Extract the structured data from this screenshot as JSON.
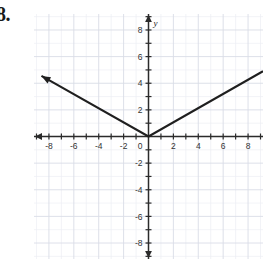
{
  "problem": {
    "number": "8."
  },
  "chart_data": {
    "type": "line",
    "title": "",
    "xlabel": "",
    "ylabel": "y",
    "x_axis_name": "",
    "y_axis_name": "y",
    "xlim": [
      -9.2,
      9.2
    ],
    "ylim": [
      -9.2,
      9.2
    ],
    "grid": true,
    "grid_minor": true,
    "grid_step_major": 2,
    "grid_step_minor": 1,
    "tick_step": 1,
    "tick_label_step": 2,
    "x_tick_labels": [
      "-8",
      "-6",
      "-4",
      "-2",
      "0",
      "2",
      "4",
      "6",
      "8"
    ],
    "x_tick_values": [
      -8,
      -6,
      -4,
      -2,
      0,
      2,
      4,
      6,
      8
    ],
    "y_tick_labels": [
      "8",
      "6",
      "4",
      "2",
      "-2",
      "-4",
      "-6",
      "-8"
    ],
    "y_tick_values": [
      8,
      6,
      4,
      2,
      -2,
      -4,
      -6,
      -8
    ],
    "origin_label": "0",
    "axis_arrows": [
      "left",
      "top",
      "bottom"
    ],
    "series": [
      {
        "name": "y = 0.5|x|",
        "equation": "y = 0.5|x|",
        "shape": "absolute-value-v",
        "vertex": [
          0,
          0
        ],
        "left_slope": -0.53,
        "right_slope": 0.53,
        "points": [
          [
            -8.6,
            4.55
          ],
          [
            0,
            0
          ],
          [
            9.2,
            4.9
          ]
        ],
        "arrow_start": true,
        "arrow_end": false,
        "color": "#1f1f1f",
        "width": 2.1
      }
    ],
    "legend": null,
    "legend_position": "none",
    "colors": {
      "curve": "#1f1f1f",
      "axis": "#2b2b2b",
      "grid_major": "#d9dde6",
      "grid_minor": "#eceef3",
      "tick_text": "#333333",
      "background": "#ffffff"
    }
  }
}
